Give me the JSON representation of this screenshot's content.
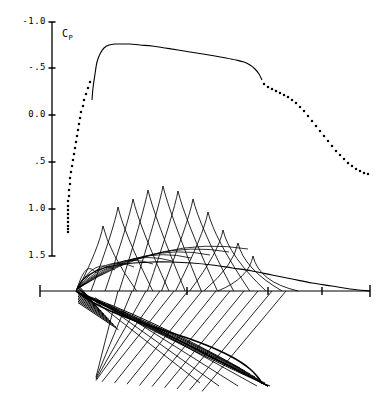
{
  "figure": {
    "name": "airfoil-pressure-distribution-with-characteristics-mesh",
    "background": "#ffffff",
    "ink": "#000000",
    "width": 388,
    "height": 397
  },
  "cp_axis": {
    "label_text": "C",
    "label_sub": "P",
    "label_full": "C P",
    "label_x": 62,
    "label_y": 28,
    "line_x": 52,
    "line_top_y": 22,
    "line_bottom_y": 256,
    "tick_len": 7,
    "ticks": [
      {
        "value": "-1.0",
        "y": 22
      },
      {
        "value": "-.5",
        "y": 68
      },
      {
        "value": "0.0",
        "y": 115
      },
      {
        "value": ".5",
        "y": 162
      },
      {
        "value": "1.0",
        "y": 209
      },
      {
        "value": "1.5",
        "y": 256
      }
    ],
    "tick_label_x": 46
  },
  "x_axis": {
    "y": 291,
    "x_start": 40,
    "x_end": 370,
    "end_cap_half": 6,
    "ticks": [
      {
        "x": 40,
        "half": 6
      },
      {
        "x": 187,
        "half": 4
      },
      {
        "x": 268,
        "half": 4
      },
      {
        "x": 322,
        "half": 4
      },
      {
        "x": 370,
        "half": 6
      }
    ]
  },
  "chart_data": {
    "type": "line",
    "title": "",
    "subtitle": "",
    "xlabel": "",
    "ylabel": "C P",
    "ylim": [
      -1.0,
      1.5
    ],
    "y_inverted": true,
    "y_ticks": [
      -1.0,
      -0.5,
      0.0,
      0.5,
      1.0,
      1.5
    ],
    "y_tick_labels": [
      "-1.0",
      "-.5",
      "0.0",
      ".5",
      "1.0",
      "1.5"
    ],
    "xlim": [
      0,
      1
    ],
    "x_ticks": [],
    "grid": false,
    "legend": null,
    "series": [
      {
        "name": "upper-surface-cp-solid",
        "style": "solid",
        "points_px": [
          [
            92,
            100
          ],
          [
            93,
            88
          ],
          [
            95,
            74
          ],
          [
            97,
            62
          ],
          [
            100,
            54
          ],
          [
            104,
            48
          ],
          [
            109,
            45
          ],
          [
            115,
            44
          ],
          [
            122,
            44
          ],
          [
            130,
            44
          ],
          [
            140,
            45
          ],
          [
            152,
            46
          ],
          [
            165,
            48
          ],
          [
            178,
            50
          ],
          [
            190,
            52
          ],
          [
            203,
            54
          ],
          [
            215,
            56
          ],
          [
            226,
            58
          ],
          [
            236,
            60
          ],
          [
            244,
            62
          ],
          [
            250,
            65
          ],
          [
            255,
            69
          ],
          [
            259,
            74
          ],
          [
            262,
            80
          ]
        ]
      },
      {
        "name": "upper-surface-cp-dotted-aft",
        "style": "dotted",
        "points_px": [
          [
            264,
            84
          ],
          [
            268,
            87
          ],
          [
            272,
            89
          ],
          [
            276,
            91
          ],
          [
            280,
            93
          ],
          [
            284,
            95
          ],
          [
            288,
            97
          ],
          [
            292,
            100
          ],
          [
            296,
            103
          ],
          [
            300,
            107
          ],
          [
            304,
            111
          ],
          [
            308,
            116
          ],
          [
            312,
            121
          ],
          [
            316,
            126
          ],
          [
            320,
            131
          ],
          [
            324,
            136
          ],
          [
            328,
            141
          ],
          [
            332,
            146
          ],
          [
            336,
            151
          ],
          [
            340,
            155
          ],
          [
            344,
            159
          ],
          [
            348,
            163
          ],
          [
            352,
            166
          ],
          [
            356,
            169
          ],
          [
            360,
            171
          ],
          [
            364,
            173
          ],
          [
            368,
            174
          ]
        ]
      },
      {
        "name": "lower-surface-cp-dotted-leading-edge",
        "style": "dotted",
        "points_px": [
          [
            90,
            82
          ],
          [
            88,
            88
          ],
          [
            86,
            94
          ],
          [
            84,
            100
          ],
          [
            83,
            106
          ],
          [
            81,
            112
          ],
          [
            80,
            118
          ],
          [
            79,
            124
          ],
          [
            78,
            130
          ],
          [
            77,
            136
          ],
          [
            76,
            142
          ],
          [
            75,
            148
          ],
          [
            74,
            154
          ],
          [
            73,
            160
          ],
          [
            72,
            166
          ],
          [
            71,
            172
          ],
          [
            70,
            178
          ],
          [
            70,
            184
          ],
          [
            69,
            190
          ],
          [
            69,
            196
          ],
          [
            68,
            201
          ],
          [
            68,
            206
          ],
          [
            68,
            210
          ],
          [
            68,
            214
          ],
          [
            68,
            218
          ],
          [
            68,
            222
          ],
          [
            68,
            226
          ],
          [
            68,
            229
          ],
          [
            68,
            232
          ]
        ]
      }
    ],
    "annotations": [
      {
        "text": "C P",
        "x_px": 62,
        "y_px": 28,
        "role": "axis-title"
      }
    ]
  },
  "airfoil": {
    "name": "airfoil-section",
    "leading_edge_px": [
      76,
      291
    ],
    "trailing_edge_px": [
      370,
      291
    ],
    "chord_start_px": 76,
    "chord_end_px": 370,
    "upper_surface_px": [
      [
        76,
        291
      ],
      [
        80,
        283
      ],
      [
        86,
        277
      ],
      [
        94,
        272
      ],
      [
        104,
        268
      ],
      [
        118,
        265
      ],
      [
        134,
        263
      ],
      [
        152,
        262
      ],
      [
        172,
        262
      ],
      [
        192,
        263
      ],
      [
        212,
        265
      ],
      [
        232,
        268
      ],
      [
        252,
        271
      ],
      [
        272,
        275
      ],
      [
        292,
        279
      ],
      [
        312,
        283
      ],
      [
        332,
        286
      ],
      [
        350,
        289
      ],
      [
        370,
        291
      ]
    ],
    "lower_surface_px": [
      [
        76,
        291
      ],
      [
        84,
        297
      ],
      [
        94,
        303
      ],
      [
        106,
        309
      ],
      [
        120,
        315
      ],
      [
        136,
        321
      ],
      [
        154,
        327
      ],
      [
        172,
        333
      ],
      [
        190,
        339
      ],
      [
        206,
        345
      ],
      [
        220,
        351
      ],
      [
        232,
        357
      ],
      [
        242,
        363
      ],
      [
        250,
        369
      ],
      [
        256,
        375
      ],
      [
        260,
        380
      ],
      [
        262,
        384
      ]
    ]
  },
  "mesh": {
    "name": "characteristics-mesh",
    "description": "Criss-crossing left- and right-running Mach lines forming a diamond lattice above and below the airfoil",
    "upper_peaks_px": [
      [
        103,
        226
      ],
      [
        118,
        207
      ],
      [
        133,
        199
      ],
      [
        148,
        190
      ],
      [
        163,
        186
      ],
      [
        178,
        191
      ],
      [
        193,
        199
      ],
      [
        208,
        212
      ],
      [
        223,
        230
      ],
      [
        238,
        243
      ],
      [
        253,
        256
      ]
    ],
    "upper_base_y": 291,
    "lower_apex_px": [
      262,
      386
    ],
    "line_count_upper": 22,
    "line_count_lower": 20
  }
}
